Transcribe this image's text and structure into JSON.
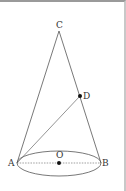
{
  "figure": {
    "type": "cone",
    "points": {
      "C": {
        "label": "C",
        "x": 59,
        "y": 29
      },
      "A": {
        "label": "A",
        "x": 17,
        "y": 161
      },
      "B": {
        "label": "B",
        "x": 101,
        "y": 161
      },
      "O": {
        "label": "O",
        "x": 59,
        "y": 161
      },
      "D": {
        "label": "D",
        "x": 80,
        "y": 94
      }
    },
    "labels": {
      "C": "C",
      "D": "D",
      "A": "A",
      "B": "B",
      "O": "O"
    },
    "colors": {
      "line": "#555555",
      "dashed": "#777777",
      "point": "#111111"
    }
  }
}
